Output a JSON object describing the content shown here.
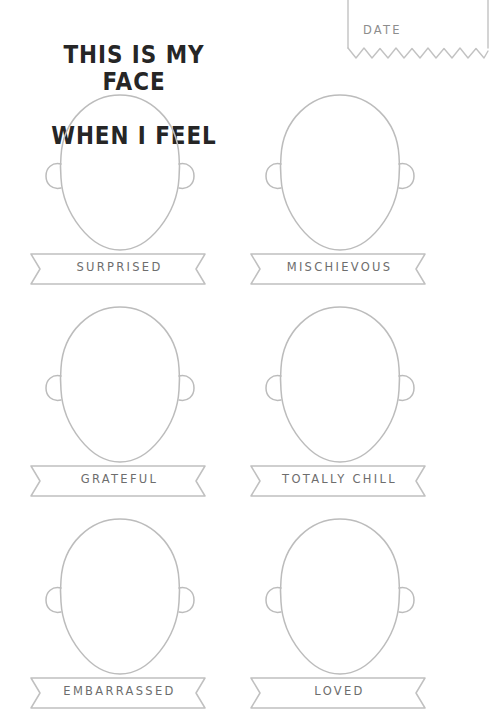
{
  "page": {
    "title_line_1": "THIS IS MY FACE",
    "title_line_2": "WHEN I FEEL",
    "title_color": "#262626",
    "line_color": "#b9b9b9",
    "label_color": "#6d6d6d",
    "background_color": "#ffffff"
  },
  "date_box": {
    "label": "DATE",
    "icon": "torn-paper-edge"
  },
  "faces": [
    {
      "emotion": "SURPRISED",
      "face_icon": "blank-face-outline",
      "banner_icon": "ribbon-banner"
    },
    {
      "emotion": "MISCHIEVOUS",
      "face_icon": "blank-face-outline",
      "banner_icon": "ribbon-banner"
    },
    {
      "emotion": "GRATEFUL",
      "face_icon": "blank-face-outline",
      "banner_icon": "ribbon-banner"
    },
    {
      "emotion": "TOTALLY CHILL",
      "face_icon": "blank-face-outline",
      "banner_icon": "ribbon-banner"
    },
    {
      "emotion": "EMBARRASSED",
      "face_icon": "blank-face-outline",
      "banner_icon": "ribbon-banner"
    },
    {
      "emotion": "LOVED",
      "face_icon": "blank-face-outline",
      "banner_icon": "ribbon-banner"
    }
  ]
}
